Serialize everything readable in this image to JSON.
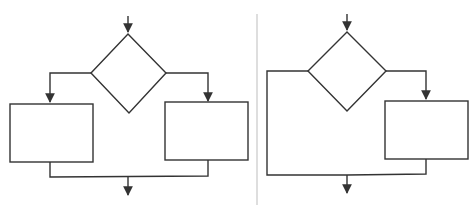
{
  "diagram": {
    "type": "flowchart-comparison",
    "colors": {
      "stroke": "#333333",
      "divider": "#c8c8c8",
      "background": "#ffffff"
    },
    "panels": [
      {
        "id": "left",
        "description": "If-else (two-branch) selection structure",
        "nodes": [
          {
            "id": "decision",
            "shape": "diamond",
            "text": ""
          },
          {
            "id": "process-true",
            "shape": "rectangle",
            "text": ""
          },
          {
            "id": "process-false",
            "shape": "rectangle",
            "text": ""
          }
        ],
        "edges": [
          {
            "from": "entry",
            "to": "decision"
          },
          {
            "from": "decision",
            "to": "process-true",
            "side": "left"
          },
          {
            "from": "decision",
            "to": "process-false",
            "side": "right"
          },
          {
            "from": "process-true",
            "to": "merge"
          },
          {
            "from": "process-false",
            "to": "merge"
          },
          {
            "from": "merge",
            "to": "exit"
          }
        ]
      },
      {
        "id": "right",
        "description": "If (single-branch) selection structure",
        "nodes": [
          {
            "id": "decision",
            "shape": "diamond",
            "text": ""
          },
          {
            "id": "process",
            "shape": "rectangle",
            "text": ""
          }
        ],
        "edges": [
          {
            "from": "entry",
            "to": "decision"
          },
          {
            "from": "decision",
            "to": "merge",
            "side": "left",
            "bypass": true
          },
          {
            "from": "decision",
            "to": "process",
            "side": "right"
          },
          {
            "from": "process",
            "to": "merge"
          },
          {
            "from": "merge",
            "to": "exit"
          }
        ]
      }
    ]
  }
}
